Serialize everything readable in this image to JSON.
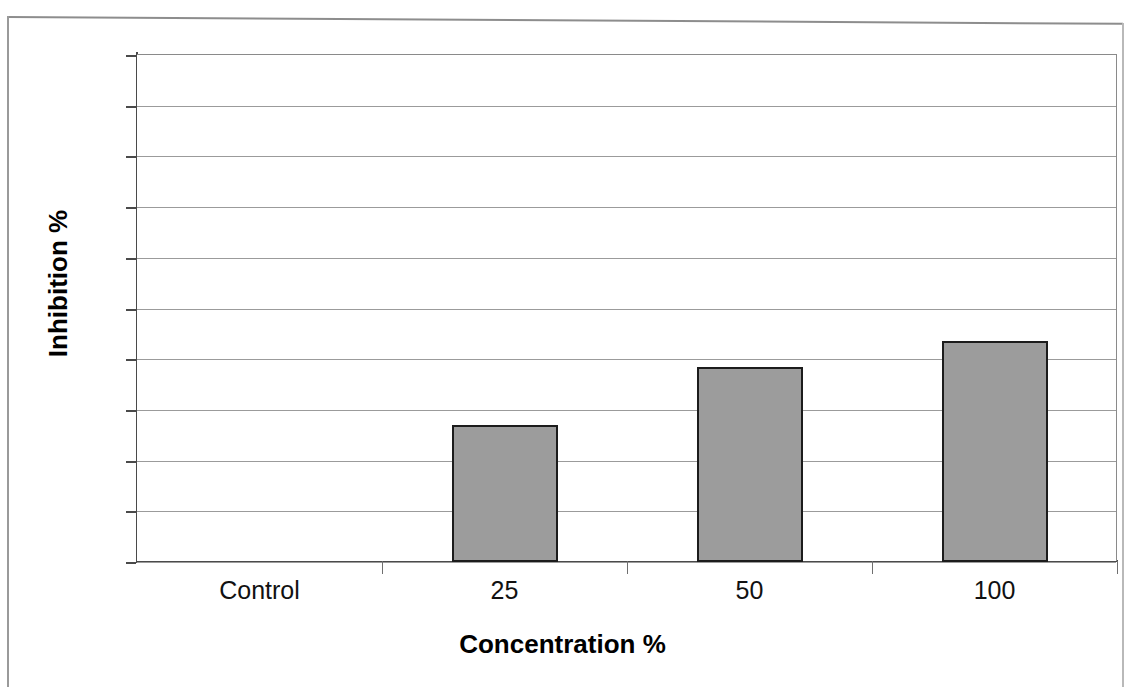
{
  "chart_data": {
    "type": "bar",
    "title": "",
    "xlabel": "Concentration %",
    "ylabel": "Inhibition %",
    "categories": [
      "Control",
      "25",
      "50",
      "100"
    ],
    "values": [
      0,
      27,
      38.5,
      43.5
    ],
    "series": [
      {
        "name": "Inhibition",
        "values": [
          0,
          27,
          38.5,
          43.5
        ]
      }
    ],
    "ylim": [
      0,
      100
    ],
    "ytick_labels": [
      "0",
      "10",
      "20",
      "30",
      "40",
      "50",
      "60",
      "70",
      "80",
      "90",
      "100"
    ],
    "ytick_values": [
      0,
      10,
      20,
      30,
      40,
      50,
      60,
      70,
      80,
      90,
      100
    ],
    "grid": "horizontal",
    "legend": "none",
    "bar_fill_color": "#9c9c9c",
    "bar_border_color": "#1c1c1c",
    "gridline_color": "#9b9b9b",
    "axis_color": "#4a4a4a",
    "background_color": "#ffffff"
  },
  "figure": {
    "frame_label": "scanned-figure-border"
  }
}
